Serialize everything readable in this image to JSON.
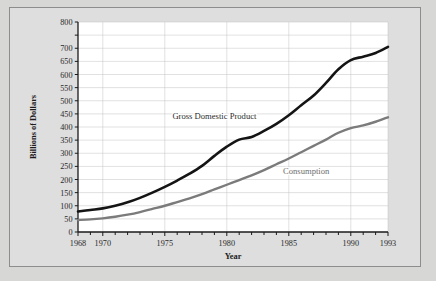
{
  "figure": {
    "background_color": "#d7d7d6",
    "plot_background_color": "#ffffff",
    "frame_color": "#8d8d8d",
    "grid_color": "#c3c3c3",
    "axis_color": "#1a1a1a"
  },
  "chart_data": {
    "type": "line",
    "title": "",
    "xlabel": "Year",
    "ylabel": "Billions of Dollars",
    "xlim": [
      1968,
      1993
    ],
    "ylim": [
      0,
      800
    ],
    "grid": true,
    "legend": "inline-annotations",
    "x_tick_labels": [
      "1968",
      "1970",
      "1975",
      "1980",
      "1985",
      "1990",
      "1993"
    ],
    "x_tick_values": [
      1968,
      1970,
      1975,
      1980,
      1985,
      1990,
      1993
    ],
    "x_minor_tick_step": 1,
    "y_tick_labels": [
      "0",
      "50",
      "100",
      "150",
      "200",
      "250",
      "300",
      "350",
      "400",
      "450",
      "500",
      "550",
      "600",
      "650",
      "700",
      "800"
    ],
    "y_tick_values": [
      0,
      50,
      100,
      150,
      200,
      250,
      300,
      350,
      400,
      450,
      500,
      550,
      600,
      650,
      700,
      750,
      800
    ],
    "x": [
      1968,
      1969,
      1970,
      1971,
      1972,
      1973,
      1974,
      1975,
      1976,
      1977,
      1978,
      1979,
      1980,
      1981,
      1982,
      1983,
      1984,
      1985,
      1986,
      1987,
      1988,
      1989,
      1990,
      1991,
      1992,
      1993
    ],
    "series": [
      {
        "name": "Gross Domestic Product",
        "color": "#141414",
        "width": 2.6,
        "label_x": 1979.0,
        "label_y": 432,
        "values": [
          78,
          84,
          90,
          100,
          113,
          130,
          150,
          172,
          196,
          222,
          252,
          290,
          325,
          352,
          362,
          385,
          412,
          445,
          483,
          520,
          568,
          620,
          655,
          668,
          682,
          705
        ]
      },
      {
        "name": "Consumption",
        "color": "#7b7b7b",
        "width": 2.4,
        "label_x": 1986.4,
        "label_y": 222,
        "values": [
          46,
          48,
          52,
          58,
          66,
          76,
          88,
          100,
          114,
          128,
          144,
          162,
          180,
          198,
          216,
          236,
          258,
          280,
          304,
          328,
          352,
          378,
          396,
          406,
          420,
          437
        ]
      }
    ]
  }
}
